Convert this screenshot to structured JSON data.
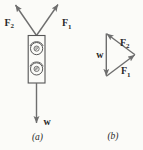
{
  "figure": {
    "colors": {
      "arrow": "#6e6e6e",
      "text": "#2a2a2a",
      "outline": "#565656",
      "background": "#fbfbf8"
    },
    "part_a": {
      "caption": "(a)",
      "force_left": {
        "base": "F",
        "sub": "2"
      },
      "force_right": {
        "base": "F",
        "sub": "1"
      },
      "weight": "w"
    },
    "part_b": {
      "caption": "(b)",
      "weight": "w",
      "force_upper": {
        "base": "F",
        "sub": "2"
      },
      "force_lower": {
        "base": "F",
        "sub": "1"
      }
    }
  }
}
